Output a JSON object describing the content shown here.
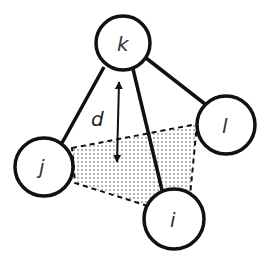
{
  "diagram": {
    "title": "",
    "colors": {
      "stroke": "#111111",
      "dots": "#555555",
      "background": "#ffffff",
      "label": "#333333"
    },
    "nodes": [
      {
        "id": "k",
        "label": "k",
        "cx": 123,
        "cy": 43,
        "r": 27
      },
      {
        "id": "l",
        "label": "l",
        "cx": 226,
        "cy": 125,
        "r": 29
      },
      {
        "id": "j",
        "label": "j",
        "cx": 44,
        "cy": 167,
        "r": 29
      },
      {
        "id": "i",
        "label": "i",
        "cx": 174,
        "cy": 219,
        "r": 30
      }
    ],
    "edges": [
      {
        "from": "k",
        "to": "j",
        "style": "solid"
      },
      {
        "from": "k",
        "to": "l",
        "style": "solid"
      },
      {
        "from": "k",
        "to": "i",
        "style": "solid"
      }
    ],
    "shaded_region": {
      "vertices": [
        "j",
        "l",
        "i"
      ],
      "fill": "dotted",
      "outline": "dashed"
    },
    "distance_arrow": {
      "label": "d",
      "x1": 119,
      "y1": 76,
      "x2": 117,
      "y2": 168,
      "heads": "both"
    }
  }
}
